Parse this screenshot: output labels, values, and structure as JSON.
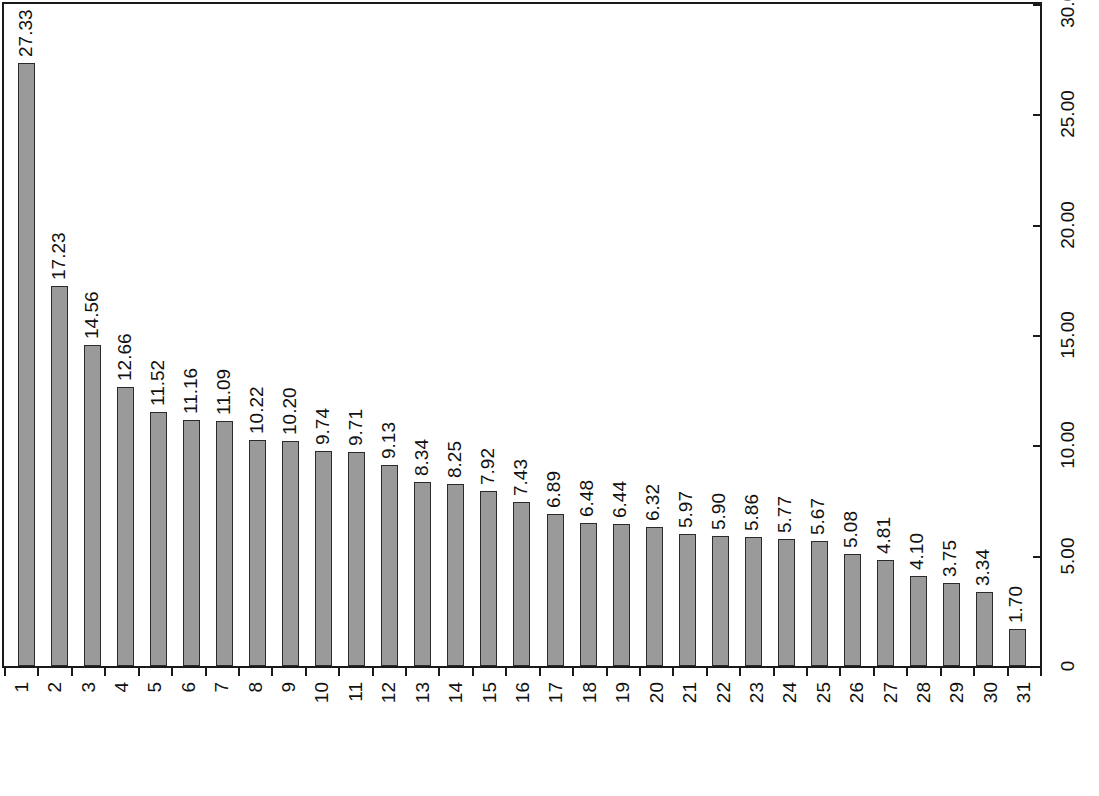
{
  "chart_data": {
    "type": "bar",
    "title": "",
    "subtitle": "",
    "xlabel": "",
    "ylabel": "",
    "ylim": [
      0,
      30
    ],
    "grid": false,
    "legend": null,
    "y_axis_position": "right",
    "x_tick_labels_rank": [
      "1",
      "2",
      "3",
      "4",
      "5",
      "6",
      "7",
      "8",
      "9",
      "10",
      "11",
      "12",
      "13",
      "14",
      "15",
      "16",
      "17",
      "18",
      "19",
      "20",
      "21",
      "22",
      "23",
      "24",
      "25",
      "26",
      "27",
      "28",
      "29",
      "30",
      "31"
    ],
    "categories": [
      "北京",
      "广东",
      "海南",
      "上海",
      "江西",
      "重庆",
      "江苏",
      "吉林",
      "天津",
      "四川",
      "陕西",
      "贵州",
      "湖南",
      "安徽",
      "湖北",
      "西藏",
      "浙江",
      "辽宁",
      "福建",
      "青海",
      "甘肃",
      "广西",
      "云南",
      "山东",
      "河南",
      "河北",
      "黑龙江",
      "宁夏",
      "山西",
      "内蒙古",
      "新疆"
    ],
    "values": [
      27.33,
      17.23,
      14.56,
      12.66,
      11.52,
      11.16,
      11.09,
      10.22,
      10.2,
      9.74,
      9.71,
      9.13,
      8.34,
      8.25,
      7.92,
      7.43,
      6.89,
      6.48,
      6.44,
      6.32,
      5.97,
      5.9,
      5.86,
      5.77,
      5.67,
      5.08,
      4.81,
      4.1,
      3.75,
      3.34,
      1.7
    ],
    "value_labels": [
      "27.33",
      "17.23",
      "14.56",
      "12.66",
      "11.52",
      "11.16",
      "11.09",
      "10.22",
      "10.20",
      "9.74",
      "9.71",
      "9.13",
      "8.34",
      "8.25",
      "7.92",
      "7.43",
      "6.89",
      "6.48",
      "6.44",
      "6.32",
      "5.97",
      "5.90",
      "5.86",
      "5.77",
      "5.67",
      "5.08",
      "4.81",
      "4.10",
      "3.75",
      "3.34",
      "1.70"
    ],
    "y_ticks": [
      0,
      5,
      10,
      15,
      20,
      25,
      30
    ],
    "y_tick_labels": [
      "0",
      "5.00",
      "10.00",
      "15.00",
      "20.00",
      "25.00",
      "30.00"
    ],
    "bar_fill_color": "#9a9a9a",
    "bar_edge_color": "#2b2b2b",
    "axis_color": "#1a1a1a",
    "background_color": "#ffffff"
  }
}
